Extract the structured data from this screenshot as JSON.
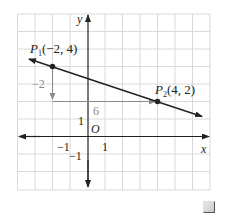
{
  "diagram": {
    "type": "coordinate-plane-slope",
    "axes": {
      "x_label": "x",
      "y_label": "y",
      "origin_label": "O"
    },
    "grid": {
      "x_min": -4,
      "x_max": 7,
      "y_min": -3,
      "y_max": 7,
      "on": true
    },
    "tick_labels": {
      "x_neg1": "−1",
      "x_pos1": "1",
      "y_pos1": "1",
      "y_neg1": "−1"
    },
    "points": [
      {
        "name": "P",
        "subscript": "1",
        "coords": "(−2, 4)",
        "x": -2,
        "y": 4
      },
      {
        "name": "P",
        "subscript": "2",
        "coords": "(4, 2)",
        "x": 4,
        "y": 2
      }
    ],
    "rise": {
      "label": "−2",
      "value": -2
    },
    "run": {
      "label": "6",
      "value": 6
    },
    "line": {
      "through": [
        "P1",
        "P2"
      ],
      "slope": "-1/3"
    },
    "colors": {
      "grid": "#d9d9d9",
      "line": "#222222",
      "arrow": "#8a8a8a"
    }
  }
}
